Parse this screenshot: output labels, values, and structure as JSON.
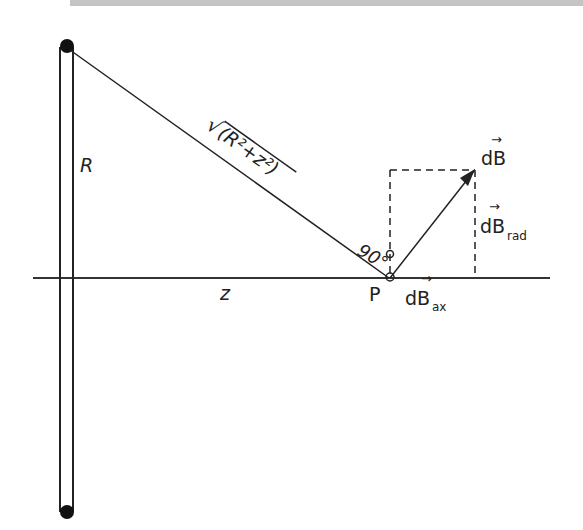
{
  "figure": {
    "labels": {
      "radius": "R",
      "distance": "z",
      "hypotenuse_sqrt": "√",
      "hypotenuse_expr": "(R²+z²)",
      "angle": "90°",
      "point": "P",
      "dB": "dB",
      "dB_rad_base": "dB",
      "dB_rad_sub": "rad",
      "dB_ax_base": "dB",
      "dB_ax_sub": "ax",
      "vector_arrow": "→"
    },
    "colors": {
      "stroke": "#222222",
      "topbar": "#c4c4c4"
    }
  }
}
